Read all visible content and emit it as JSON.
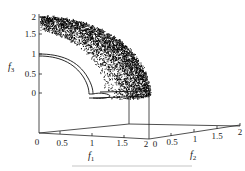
{
  "chart_data": {
    "type": "scatter",
    "subtype": "3d-scatter",
    "title": "",
    "axes": {
      "x": {
        "label": "f1",
        "ticks": [
          "0",
          "0.5",
          "1",
          "1.5",
          "2"
        ],
        "range": [
          0,
          2
        ]
      },
      "y": {
        "label": "f2",
        "ticks": [
          "0",
          "0.5",
          "1",
          "1.5",
          "2"
        ],
        "range": [
          0,
          2
        ]
      },
      "z": {
        "label": "f3",
        "ticks": [
          "0",
          "0.5",
          "1",
          "1.5",
          "2"
        ],
        "range": [
          0,
          2
        ]
      }
    },
    "series": [
      {
        "name": "obtained solutions",
        "style": "dense black points",
        "description": "points on/near spherical surface f1^2+f2^2+f3^2 ≈ 4 in the positive octant, dense near the outer edge"
      },
      {
        "name": "reference front",
        "style": "thin black lines",
        "description": "arc of unit-radius sphere (f3 from 1 down to 0) with a small loop near f3≈0"
      }
    ],
    "grid": false,
    "legend": null,
    "caption_legible": false
  },
  "labels": {
    "f1": "f",
    "f1_sub": "1",
    "f2": "f",
    "f2_sub": "2",
    "f3": "f",
    "f3_sub": "3"
  },
  "ticks": {
    "z": [
      "2",
      "1.5",
      "1",
      "0.5",
      "0"
    ],
    "x": [
      "0",
      "0.5",
      "1",
      "1.5",
      "2"
    ],
    "y": [
      "0",
      "0.5",
      "1",
      "1.5",
      "2"
    ]
  }
}
